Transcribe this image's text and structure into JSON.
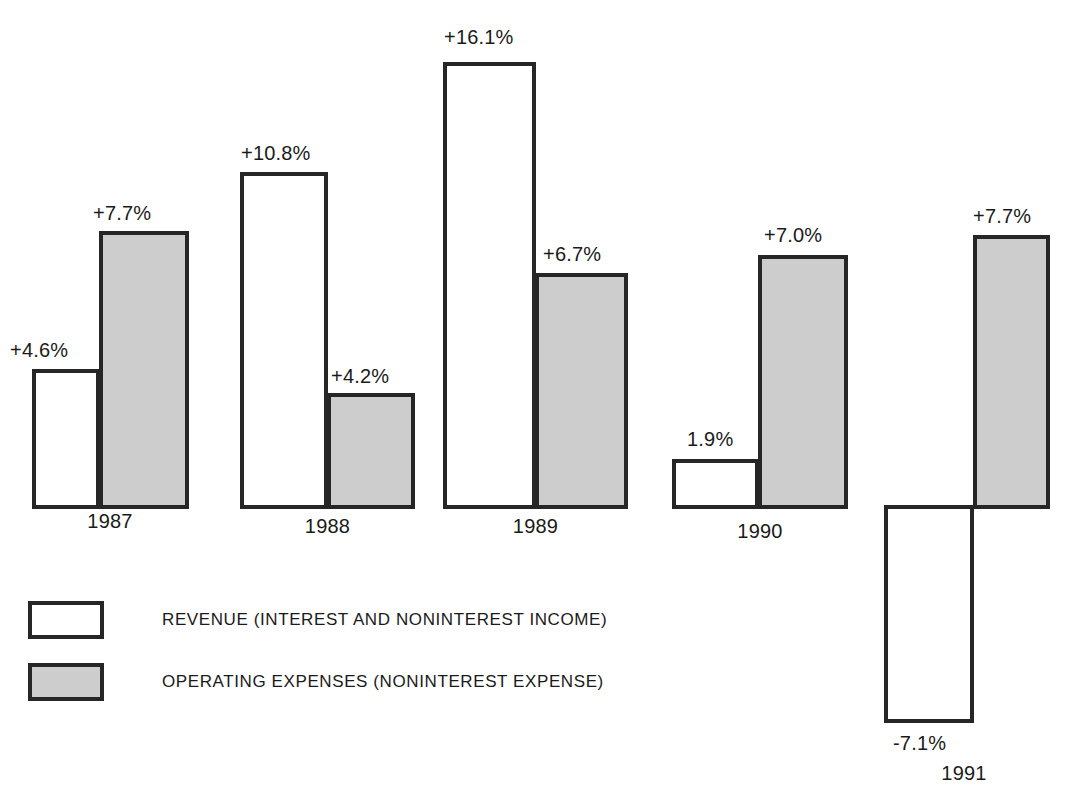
{
  "chart_data": {
    "type": "bar",
    "title": "",
    "subtitle": "",
    "xlabel": "",
    "ylabel": "",
    "grid": false,
    "legend_position": "bottom-left",
    "categories": [
      "1987",
      "1988",
      "1989",
      "1990",
      "1991"
    ],
    "series": [
      {
        "name": "REVENUE (INTEREST AND NONINTEREST INCOME)",
        "fill": "#ffffff",
        "values": [
          4.6,
          10.8,
          16.1,
          1.9,
          -7.1
        ],
        "labels": [
          "+4.6%",
          "+10.8%",
          "+16.1%",
          "1.9%",
          "-7.1%"
        ]
      },
      {
        "name": "OPERATING EXPENSES (NONINTEREST EXPENSE)",
        "fill": "#cdcdcd",
        "values": [
          7.7,
          4.2,
          6.7,
          7.0,
          7.7
        ],
        "labels": [
          "+7.7%",
          "+4.2%",
          "+6.7%",
          "+7.0%",
          "+7.7%"
        ]
      }
    ],
    "ylim": [
      -7.1,
      16.1
    ],
    "annotations": []
  },
  "legend": {
    "items": [
      {
        "label": "REVENUE (INTEREST AND NONINTEREST INCOME)",
        "swatch": "revenue"
      },
      {
        "label": "OPERATING EXPENSES (NONINTEREST EXPENSE)",
        "swatch": "expense"
      }
    ]
  },
  "colors": {
    "outline": "#262626",
    "revenue_fill": "#ffffff",
    "expense_fill": "#cdcdcd",
    "text": "#1a1a1a"
  },
  "groups": [
    {
      "year": "1987",
      "year_label_left": 32,
      "year_label_width": 156,
      "year_label_top": 511,
      "revenue": {
        "left": 32,
        "width": 68,
        "top": 369,
        "height": 140,
        "label": "+4.6%",
        "label_left": 10,
        "label_top": 340
      },
      "expense": {
        "left": 99,
        "width": 90,
        "top": 231,
        "height": 278,
        "label": "+7.7%",
        "label_left": 93,
        "label_top": 203
      }
    },
    {
      "year": "1988",
      "year_label_left": 240,
      "year_label_width": 175,
      "year_label_top": 516,
      "revenue": {
        "left": 240,
        "width": 88,
        "top": 172,
        "height": 337,
        "label": "+10.8%",
        "label_left": 241,
        "label_top": 143
      },
      "expense": {
        "left": 327,
        "width": 88,
        "top": 393,
        "height": 116,
        "label": "+4.2%",
        "label_left": 331,
        "label_top": 366
      }
    },
    {
      "year": "1989",
      "year_label_left": 443,
      "year_label_width": 185,
      "year_label_top": 516,
      "revenue": {
        "left": 443,
        "width": 93,
        "top": 62,
        "height": 447,
        "label": "+16.1%",
        "label_left": 444,
        "label_top": 27
      },
      "expense": {
        "left": 535,
        "width": 93,
        "top": 273,
        "height": 236,
        "label": "+6.7%",
        "label_left": 543,
        "label_top": 244
      }
    },
    {
      "year": "1990",
      "year_label_left": 672,
      "year_label_width": 176,
      "year_label_top": 521,
      "revenue": {
        "left": 672,
        "width": 87,
        "top": 459,
        "height": 50,
        "label": "1.9%",
        "label_left": 687,
        "label_top": 429
      },
      "expense": {
        "left": 758,
        "width": 90,
        "top": 255,
        "height": 254,
        "label": "+7.0%",
        "label_left": 764,
        "label_top": 225
      }
    },
    {
      "year": "1991",
      "year_label_left": 884,
      "year_label_width": 160,
      "year_label_top": 763,
      "revenue": {
        "left": 884,
        "width": 90,
        "top": 505,
        "height": 218,
        "label": "-7.1%",
        "label_left": 893,
        "label_top": 733
      },
      "expense": {
        "left": 973,
        "width": 77,
        "top": 235,
        "height": 274,
        "label": "+7.7%",
        "label_left": 973,
        "label_top": 206
      }
    }
  ]
}
